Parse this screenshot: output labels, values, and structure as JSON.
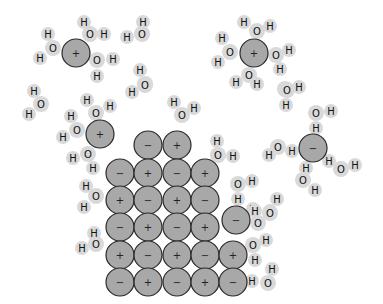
{
  "diagram": {
    "colors": {
      "ion_fill": "#a8a8a8",
      "ion_stroke": "#2a2a2a",
      "water_halo": "#d9d9d9",
      "label": "#111111"
    },
    "ion_radius": 14,
    "lattice": [
      {
        "x": 148,
        "y": 145,
        "sign": "−"
      },
      {
        "x": 177,
        "y": 145,
        "sign": "+"
      },
      {
        "x": 120,
        "y": 173,
        "sign": "−"
      },
      {
        "x": 148,
        "y": 173,
        "sign": "+"
      },
      {
        "x": 177,
        "y": 173,
        "sign": "−"
      },
      {
        "x": 205,
        "y": 173,
        "sign": "+"
      },
      {
        "x": 120,
        "y": 200,
        "sign": "+"
      },
      {
        "x": 148,
        "y": 200,
        "sign": "−"
      },
      {
        "x": 177,
        "y": 200,
        "sign": "+"
      },
      {
        "x": 205,
        "y": 200,
        "sign": "−"
      },
      {
        "x": 120,
        "y": 227,
        "sign": "−"
      },
      {
        "x": 148,
        "y": 227,
        "sign": "+"
      },
      {
        "x": 177,
        "y": 227,
        "sign": "−"
      },
      {
        "x": 205,
        "y": 227,
        "sign": "+"
      },
      {
        "x": 120,
        "y": 255,
        "sign": "+"
      },
      {
        "x": 148,
        "y": 255,
        "sign": "−"
      },
      {
        "x": 177,
        "y": 255,
        "sign": "+"
      },
      {
        "x": 205,
        "y": 255,
        "sign": "−"
      },
      {
        "x": 233,
        "y": 255,
        "sign": "+"
      },
      {
        "x": 120,
        "y": 282,
        "sign": "−"
      },
      {
        "x": 148,
        "y": 282,
        "sign": "+"
      },
      {
        "x": 177,
        "y": 282,
        "sign": "−"
      },
      {
        "x": 205,
        "y": 282,
        "sign": "+"
      },
      {
        "x": 233,
        "y": 282,
        "sign": "−"
      }
    ],
    "free_ions": [
      {
        "x": 76,
        "y": 53,
        "sign": "+",
        "name": "hydrated-sodium-ion-top-left"
      },
      {
        "x": 254,
        "y": 53,
        "sign": "+",
        "name": "hydrated-sodium-ion-top-right"
      },
      {
        "x": 100,
        "y": 134,
        "sign": "+",
        "name": "hydrated-sodium-ion-middle-left"
      },
      {
        "x": 313,
        "y": 148,
        "sign": "−",
        "name": "hydrated-chloride-ion-right"
      },
      {
        "x": 236,
        "y": 220,
        "sign": "−",
        "name": "detaching-chloride-ion"
      }
    ],
    "atoms": [
      {
        "x": 53,
        "y": 48,
        "e": "O"
      },
      {
        "x": 48,
        "y": 34,
        "e": "H"
      },
      {
        "x": 40,
        "y": 58,
        "e": "H"
      },
      {
        "x": 90,
        "y": 34,
        "e": "O"
      },
      {
        "x": 84,
        "y": 22,
        "e": "H"
      },
      {
        "x": 104,
        "y": 34,
        "e": "H"
      },
      {
        "x": 97,
        "y": 60,
        "e": "O"
      },
      {
        "x": 113,
        "y": 59,
        "e": "H"
      },
      {
        "x": 97,
        "y": 76,
        "e": "H"
      },
      {
        "x": 142,
        "y": 34,
        "e": "O"
      },
      {
        "x": 143,
        "y": 22,
        "e": "H"
      },
      {
        "x": 127,
        "y": 37,
        "e": "H"
      },
      {
        "x": 145,
        "y": 84,
        "e": "O"
      },
      {
        "x": 140,
        "y": 70,
        "e": "H"
      },
      {
        "x": 132,
        "y": 92,
        "e": "H"
      },
      {
        "x": 257,
        "y": 31,
        "e": "O"
      },
      {
        "x": 244,
        "y": 22,
        "e": "H"
      },
      {
        "x": 270,
        "y": 26,
        "e": "H"
      },
      {
        "x": 230,
        "y": 52,
        "e": "O"
      },
      {
        "x": 222,
        "y": 38,
        "e": "H"
      },
      {
        "x": 218,
        "y": 62,
        "e": "H"
      },
      {
        "x": 276,
        "y": 55,
        "e": "O"
      },
      {
        "x": 289,
        "y": 50,
        "e": "H"
      },
      {
        "x": 280,
        "y": 69,
        "e": "H"
      },
      {
        "x": 249,
        "y": 75,
        "e": "O"
      },
      {
        "x": 236,
        "y": 82,
        "e": "H"
      },
      {
        "x": 257,
        "y": 84,
        "e": "H"
      },
      {
        "x": 285,
        "y": 89,
        "e": "O"
      },
      {
        "x": 299,
        "y": 87,
        "e": "H"
      },
      {
        "x": 286,
        "y": 105,
        "e": "H"
      },
      {
        "x": 41,
        "y": 104,
        "e": "O"
      },
      {
        "x": 34,
        "y": 91,
        "e": "H"
      },
      {
        "x": 29,
        "y": 114,
        "e": "H"
      },
      {
        "x": 96,
        "y": 113,
        "e": "O"
      },
      {
        "x": 87,
        "y": 100,
        "e": "H"
      },
      {
        "x": 110,
        "y": 106,
        "e": "H"
      },
      {
        "x": 77,
        "y": 130,
        "e": "O"
      },
      {
        "x": 71,
        "y": 116,
        "e": "H"
      },
      {
        "x": 63,
        "y": 137,
        "e": "H"
      },
      {
        "x": 88,
        "y": 154,
        "e": "O"
      },
      {
        "x": 73,
        "y": 158,
        "e": "H"
      },
      {
        "x": 93,
        "y": 168,
        "e": "H"
      },
      {
        "x": 145,
        "y": 85,
        "e": "O"
      },
      {
        "x": 182,
        "y": 115,
        "e": "O"
      },
      {
        "x": 174,
        "y": 102,
        "e": "H"
      },
      {
        "x": 194,
        "y": 108,
        "e": "H"
      },
      {
        "x": 96,
        "y": 196,
        "e": "O"
      },
      {
        "x": 86,
        "y": 186,
        "e": "H"
      },
      {
        "x": 84,
        "y": 207,
        "e": "H"
      },
      {
        "x": 96,
        "y": 244,
        "e": "O"
      },
      {
        "x": 94,
        "y": 233,
        "e": "H"
      },
      {
        "x": 82,
        "y": 248,
        "e": "H"
      },
      {
        "x": 218,
        "y": 155,
        "e": "O"
      },
      {
        "x": 217,
        "y": 141,
        "e": "H"
      },
      {
        "x": 233,
        "y": 156,
        "e": "H"
      },
      {
        "x": 287,
        "y": 90,
        "e": "O"
      },
      {
        "x": 258,
        "y": 223,
        "e": "O"
      },
      {
        "x": 253,
        "y": 209,
        "e": "H"
      },
      {
        "x": 270,
        "y": 211,
        "e": "H"
      },
      {
        "x": 238,
        "y": 184,
        "e": "O"
      },
      {
        "x": 252,
        "y": 181,
        "e": "H"
      },
      {
        "x": 238,
        "y": 199,
        "e": "H"
      },
      {
        "x": 270,
        "y": 213,
        "e": "O"
      },
      {
        "x": 277,
        "y": 199,
        "e": "H"
      },
      {
        "x": 255,
        "y": 211,
        "e": "H"
      },
      {
        "x": 253,
        "y": 245,
        "e": "O"
      },
      {
        "x": 266,
        "y": 240,
        "e": "H"
      },
      {
        "x": 255,
        "y": 260,
        "e": "H"
      },
      {
        "x": 268,
        "y": 283,
        "e": "O"
      },
      {
        "x": 272,
        "y": 269,
        "e": "H"
      },
      {
        "x": 252,
        "y": 281,
        "e": "H"
      },
      {
        "x": 278,
        "y": 147,
        "e": "O"
      },
      {
        "x": 269,
        "y": 155,
        "e": "H"
      },
      {
        "x": 292,
        "y": 151,
        "e": "H"
      },
      {
        "x": 316,
        "y": 113,
        "e": "O"
      },
      {
        "x": 331,
        "y": 111,
        "e": "H"
      },
      {
        "x": 316,
        "y": 128,
        "e": "H"
      },
      {
        "x": 341,
        "y": 169,
        "e": "O"
      },
      {
        "x": 329,
        "y": 161,
        "e": "H"
      },
      {
        "x": 355,
        "y": 165,
        "e": "H"
      },
      {
        "x": 303,
        "y": 180,
        "e": "O"
      },
      {
        "x": 306,
        "y": 168,
        "e": "H"
      },
      {
        "x": 315,
        "y": 190,
        "e": "H"
      }
    ]
  }
}
